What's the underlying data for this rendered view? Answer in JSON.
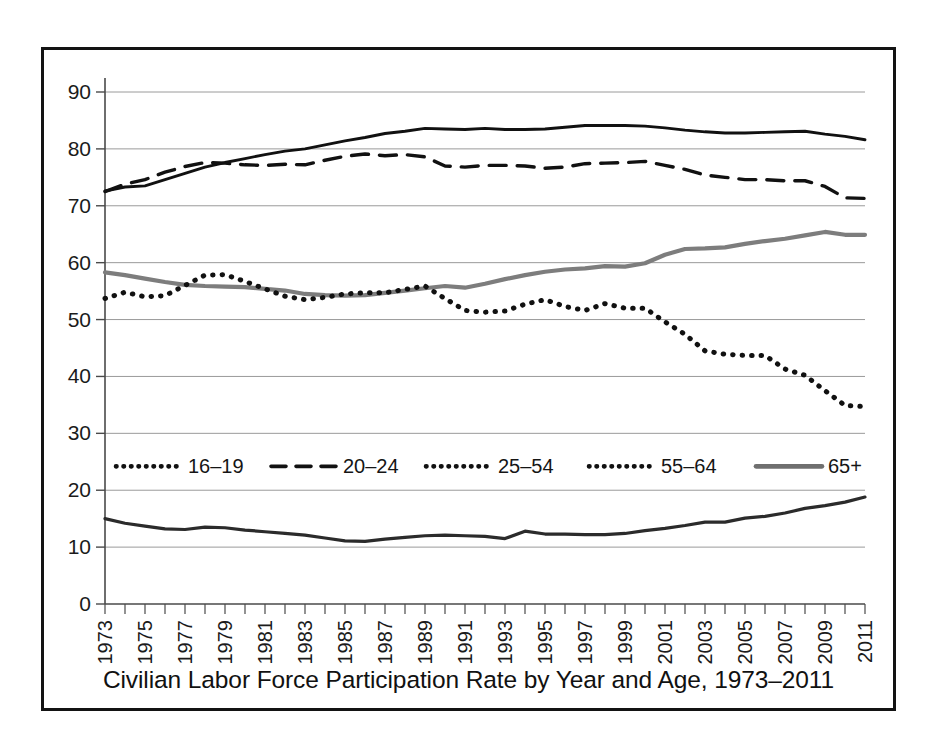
{
  "figure": {
    "caption": "Civilian Labor Force Participation Rate by Year and Age, 1973–2011",
    "frame_color": "#131313",
    "background": "#ffffff"
  },
  "chart_data": {
    "type": "line",
    "title": "Civilian Labor Force Participation Rate by Year and Age, 1973–2011",
    "xlabel": "",
    "ylabel": "",
    "xlim": [
      1973,
      2011
    ],
    "ylim": [
      0,
      90
    ],
    "ytick_labels": [
      "0",
      "10",
      "20",
      "30",
      "40",
      "50",
      "60",
      "70",
      "80",
      "90"
    ],
    "yticks": [
      0,
      10,
      20,
      30,
      40,
      50,
      60,
      70,
      80,
      90
    ],
    "grid": "horizontal",
    "legend_position": "inside-middle",
    "x": [
      1973,
      1974,
      1975,
      1976,
      1977,
      1978,
      1979,
      1980,
      1981,
      1982,
      1983,
      1984,
      1985,
      1986,
      1987,
      1988,
      1989,
      1990,
      1991,
      1992,
      1993,
      1994,
      1995,
      1996,
      1997,
      1998,
      1999,
      2000,
      2001,
      2002,
      2003,
      2004,
      2005,
      2006,
      2007,
      2008,
      2009,
      2010,
      2011
    ],
    "xtick_labels": [
      "1973",
      "1975",
      "1977",
      "1979",
      "1981",
      "1983",
      "1985",
      "1987",
      "1989",
      "1991",
      "1993",
      "1995",
      "1997",
      "1999",
      "2001",
      "2003",
      "2005",
      "2007",
      "2009",
      "2011"
    ],
    "series": [
      {
        "name": "16–19",
        "style": "dotted",
        "color": "#111111",
        "values": [
          53.7,
          54.8,
          54.0,
          54.2,
          56.0,
          57.8,
          57.9,
          56.7,
          55.4,
          54.1,
          53.5,
          53.9,
          54.5,
          54.7,
          54.7,
          55.3,
          55.9,
          53.7,
          51.6,
          51.3,
          51.5,
          52.7,
          53.5,
          52.3,
          51.6,
          52.8,
          52.0,
          52.0,
          49.6,
          47.4,
          44.5,
          43.9,
          43.7,
          43.7,
          41.3,
          40.2,
          37.5,
          34.9,
          34.7
        ]
      },
      {
        "name": "20–24",
        "style": "dashed",
        "color": "#111111",
        "values": [
          72.5,
          73.8,
          74.6,
          75.9,
          76.9,
          77.6,
          77.5,
          77.2,
          77.1,
          77.3,
          77.2,
          78.0,
          78.7,
          79.1,
          78.8,
          79.0,
          78.6,
          77.0,
          76.8,
          77.1,
          77.1,
          77.0,
          76.6,
          76.8,
          77.4,
          77.5,
          77.6,
          77.8,
          77.1,
          76.4,
          75.4,
          75.0,
          74.6,
          74.6,
          74.4,
          74.4,
          73.4,
          71.4,
          71.3
        ]
      },
      {
        "name": "25–54",
        "style": "solid",
        "color": "#111111",
        "values": [
          72.6,
          73.3,
          73.5,
          74.6,
          75.7,
          76.8,
          77.6,
          78.3,
          79.0,
          79.6,
          80.0,
          80.7,
          81.4,
          82.0,
          82.7,
          83.1,
          83.6,
          83.5,
          83.4,
          83.6,
          83.4,
          83.4,
          83.5,
          83.8,
          84.1,
          84.1,
          84.1,
          84.0,
          83.7,
          83.3,
          83.0,
          82.8,
          82.8,
          82.9,
          83.0,
          83.1,
          82.6,
          82.2,
          81.6
        ]
      },
      {
        "name": "55–64",
        "style": "dotted-heavy",
        "color": "#111111",
        "values": [
          53.7,
          54.8,
          54.0,
          54.2,
          56.0,
          57.8,
          57.9,
          56.7,
          55.4,
          54.1,
          53.5,
          53.9,
          54.5,
          54.7,
          54.7,
          55.3,
          55.9,
          53.7,
          51.6,
          51.3,
          51.5,
          52.7,
          53.5,
          52.3,
          51.6,
          52.8,
          52.0,
          52.0,
          49.6,
          47.4,
          44.5,
          43.9,
          43.7,
          43.7,
          41.3,
          40.2,
          37.5,
          34.9,
          34.7
        ]
      },
      {
        "name": "65+",
        "style": "solid-gray",
        "color": "#7d7d7d",
        "values": [
          58.3,
          57.8,
          57.2,
          56.6,
          56.1,
          55.9,
          55.8,
          55.7,
          55.4,
          55.1,
          54.5,
          54.3,
          54.2,
          54.3,
          54.7,
          55.1,
          55.5,
          55.9,
          55.6,
          56.3,
          57.1,
          57.8,
          58.4,
          58.8,
          59.0,
          59.4,
          59.3,
          59.9,
          61.4,
          62.4,
          62.5,
          62.7,
          63.3,
          63.8,
          64.2,
          64.8,
          65.4,
          64.9,
          64.9
        ]
      },
      {
        "name": "65+-low",
        "style": "solid-dark",
        "color": "#2a2a2a",
        "values": [
          15.0,
          14.2,
          13.7,
          13.2,
          13.1,
          13.5,
          13.4,
          13.0,
          12.7,
          12.4,
          12.1,
          11.6,
          11.1,
          11.0,
          11.4,
          11.7,
          12.0,
          12.1,
          12.0,
          11.9,
          11.5,
          12.8,
          12.3,
          12.3,
          12.2,
          12.2,
          12.4,
          12.9,
          13.3,
          13.8,
          14.4,
          14.4,
          15.1,
          15.4,
          16.0,
          16.8,
          17.3,
          17.9,
          18.8
        ]
      }
    ],
    "legend": [
      {
        "label": "16–19",
        "style": "dotted",
        "color": "#111111"
      },
      {
        "label": "20–24",
        "style": "dashed",
        "color": "#111111"
      },
      {
        "label": "25–54",
        "style": "dotted",
        "color": "#111111"
      },
      {
        "label": "55–64",
        "style": "dotted",
        "color": "#111111"
      },
      {
        "label": "65+",
        "style": "solid",
        "color": "#6f6f6f"
      }
    ]
  }
}
